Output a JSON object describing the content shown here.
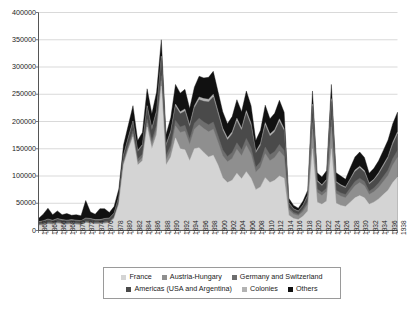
{
  "chart_data": {
    "type": "area",
    "title": "",
    "subtitle": "",
    "xlabel": "",
    "ylabel": "",
    "stacked": true,
    "grid": true,
    "legend_position": "bottom",
    "ylim": [
      0,
      400000
    ],
    "ytick_step": 50000,
    "ytick_labels": [
      "400000",
      "350000",
      "300000",
      "250000",
      "200000",
      "150000",
      "100000",
      "50000",
      "0"
    ],
    "ytick_values": [
      400000,
      350000,
      300000,
      250000,
      200000,
      150000,
      100000,
      50000,
      0
    ],
    "xlim": [
      1862,
      1938
    ],
    "xtick_step": 2,
    "xtick_labels": [
      "1862",
      "1864",
      "1866",
      "1868",
      "1870",
      "1872",
      "1874",
      "1876",
      "1878",
      "1880",
      "1882",
      "1884",
      "1886",
      "1888",
      "1890",
      "1892",
      "1894",
      "1896",
      "1898",
      "1900",
      "1902",
      "1904",
      "1906",
      "1908",
      "1910",
      "1912",
      "1914",
      "1916",
      "1918",
      "1920",
      "1922",
      "1924",
      "1926",
      "1928",
      "1930",
      "1932",
      "1934",
      "1936",
      "1938"
    ],
    "x": [
      1862,
      1863,
      1864,
      1865,
      1866,
      1867,
      1868,
      1869,
      1870,
      1871,
      1872,
      1873,
      1874,
      1875,
      1876,
      1877,
      1878,
      1879,
      1880,
      1881,
      1882,
      1883,
      1884,
      1885,
      1886,
      1887,
      1888,
      1889,
      1890,
      1891,
      1892,
      1893,
      1894,
      1895,
      1896,
      1897,
      1898,
      1899,
      1900,
      1901,
      1902,
      1903,
      1904,
      1905,
      1906,
      1907,
      1908,
      1909,
      1910,
      1911,
      1912,
      1913,
      1914,
      1915,
      1916,
      1917,
      1918,
      1919,
      1920,
      1921,
      1922,
      1923,
      1924,
      1925,
      1926,
      1927,
      1928,
      1929,
      1930,
      1931,
      1932,
      1933,
      1934,
      1935,
      1936,
      1937,
      1938
    ],
    "series": [
      {
        "name": "France",
        "color": "#d4d4d4",
        "values": [
          9000,
          10000,
          12000,
          11000,
          13000,
          12000,
          11000,
          12000,
          11000,
          10000,
          14000,
          13000,
          12000,
          12000,
          13000,
          14000,
          22000,
          48000,
          120000,
          148000,
          172000,
          120000,
          128000,
          190000,
          150000,
          176000,
          265000,
          120000,
          135000,
          170000,
          150000,
          148000,
          128000,
          150000,
          152000,
          143000,
          135000,
          138000,
          120000,
          97000,
          88000,
          92000,
          105000,
          95000,
          108000,
          96000,
          75000,
          80000,
          97000,
          88000,
          92000,
          100000,
          96000,
          28000,
          22000,
          20000,
          26000,
          36000,
          150000,
          52000,
          48000,
          54000,
          150000,
          50000,
          46000,
          44000,
          52000,
          60000,
          64000,
          60000,
          48000,
          52000,
          58000,
          66000,
          74000,
          88000,
          98000
        ]
      },
      {
        "name": "Austria-Hungary",
        "color": "#8f8f8f",
        "values": [
          1000,
          1000,
          1000,
          1000,
          1000,
          1000,
          1000,
          1000,
          1000,
          1000,
          1000,
          1000,
          1000,
          1000,
          1000,
          1000,
          1000,
          2000,
          3000,
          4000,
          5000,
          5000,
          6000,
          7000,
          8000,
          9000,
          10000,
          9000,
          12000,
          22000,
          30000,
          34000,
          30000,
          36000,
          42000,
          44000,
          46000,
          48000,
          42000,
          40000,
          38000,
          40000,
          44000,
          42000,
          48000,
          44000,
          32000,
          36000,
          44000,
          40000,
          42000,
          46000,
          40000,
          10000,
          8000,
          7000,
          9000,
          12000,
          36000,
          18000,
          16000,
          18000,
          40000,
          18000,
          17000,
          16000,
          19000,
          22000,
          24000,
          22000,
          18000,
          19000,
          21000,
          24000,
          27000,
          32000,
          36000
        ]
      },
      {
        "name": "Germany and Switzerland",
        "color": "#6e6e6e",
        "values": [
          2000,
          2000,
          2000,
          2000,
          2000,
          2000,
          2000,
          2000,
          2000,
          2000,
          2000,
          2000,
          2000,
          2000,
          2000,
          2000,
          2000,
          3000,
          4000,
          5000,
          6000,
          6000,
          6000,
          7000,
          7000,
          8000,
          9000,
          8000,
          9000,
          10000,
          10000,
          11000,
          10000,
          11000,
          12000,
          12000,
          13000,
          13000,
          12000,
          11000,
          10000,
          11000,
          12000,
          11000,
          13000,
          12000,
          9000,
          10000,
          12000,
          11000,
          11000,
          12000,
          11000,
          4000,
          3000,
          3000,
          4000,
          5000,
          12000,
          6000,
          6000,
          6000,
          13000,
          6000,
          6000,
          6000,
          7000,
          8000,
          8000,
          8000,
          6000,
          7000,
          8000,
          9000,
          10000,
          12000,
          13000
        ]
      },
      {
        "name": "Americas (USA and Argentina)",
        "color": "#4a4a4a",
        "values": [
          3000,
          4000,
          5000,
          4000,
          5000,
          4000,
          4000,
          4000,
          4000,
          4000,
          5000,
          5000,
          4000,
          4000,
          5000,
          5000,
          6000,
          8000,
          10000,
          12000,
          16000,
          14000,
          16000,
          22000,
          20000,
          24000,
          32000,
          18000,
          24000,
          26000,
          24000,
          26000,
          22000,
          28000,
          34000,
          38000,
          42000,
          46000,
          40000,
          36000,
          30000,
          34000,
          40000,
          36000,
          46000,
          40000,
          26000,
          30000,
          40000,
          34000,
          36000,
          42000,
          36000,
          8000,
          6000,
          5000,
          7000,
          10000,
          30000,
          14000,
          12000,
          14000,
          34000,
          14000,
          13000,
          12000,
          15000,
          18000,
          19000,
          17000,
          13000,
          14000,
          16000,
          19000,
          22000,
          26000,
          30000
        ]
      },
      {
        "name": "Colonies",
        "color": "#b3b3b3",
        "values": [
          1000,
          1000,
          1000,
          1000,
          1000,
          1000,
          1000,
          1000,
          1000,
          1000,
          1000,
          1000,
          1000,
          1000,
          1000,
          1000,
          1000,
          1000,
          2000,
          2000,
          2000,
          2000,
          2000,
          3000,
          3000,
          3000,
          4000,
          3000,
          3000,
          4000,
          4000,
          4000,
          4000,
          4000,
          5000,
          5000,
          5000,
          5000,
          5000,
          4000,
          4000,
          4000,
          5000,
          4000,
          5000,
          5000,
          3000,
          4000,
          5000,
          4000,
          4000,
          5000,
          4000,
          1000,
          1000,
          1000,
          1000,
          2000,
          4000,
          2000,
          2000,
          2000,
          5000,
          2000,
          2000,
          2000,
          2000,
          3000,
          3000,
          3000,
          2000,
          2000,
          3000,
          3000,
          3000,
          4000,
          4000
        ]
      },
      {
        "name": "Others",
        "color": "#111111",
        "values": [
          6000,
          12000,
          20000,
          10000,
          14000,
          9000,
          12000,
          8000,
          10000,
          9000,
          32000,
          12000,
          10000,
          20000,
          18000,
          10000,
          12000,
          14000,
          18000,
          22000,
          28000,
          18000,
          22000,
          31000,
          26000,
          34000,
          30000,
          18000,
          24000,
          36000,
          34000,
          36000,
          30000,
          34000,
          38000,
          38000,
          40000,
          42000,
          36000,
          30000,
          26000,
          28000,
          34000,
          30000,
          36000,
          32000,
          20000,
          24000,
          32000,
          28000,
          30000,
          34000,
          30000,
          8000,
          6000,
          5000,
          7000,
          9000,
          24000,
          14000,
          14000,
          16000,
          26000,
          16000,
          16000,
          14000,
          20000,
          24000,
          26000,
          24000,
          18000,
          20000,
          22000,
          26000,
          30000,
          34000,
          36000
        ]
      }
    ]
  },
  "legend": {
    "rows": [
      [
        {
          "label": "France",
          "color": "#d4d4d4"
        },
        {
          "label": "Austria-Hungary",
          "color": "#8f8f8f"
        },
        {
          "label": "Germany and Switzerland",
          "color": "#6e6e6e"
        }
      ],
      [
        {
          "label": "Americas (USA and Argentina)",
          "color": "#4a4a4a"
        },
        {
          "label": "Colonies",
          "color": "#b3b3b3"
        },
        {
          "label": "Others",
          "color": "#111111"
        }
      ]
    ]
  }
}
